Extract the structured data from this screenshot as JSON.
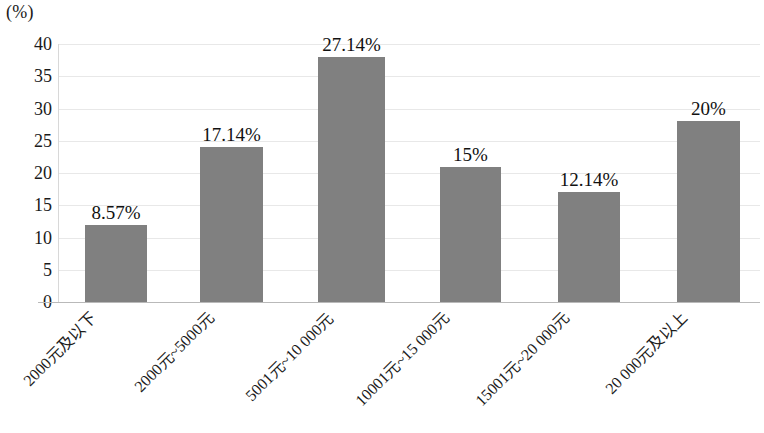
{
  "chart_data": {
    "type": "bar",
    "title": "",
    "subtitle": "",
    "xlabel": "",
    "ylabel": "(%)",
    "unit_caption": "(%)",
    "categories": [
      "2000元及以下",
      "2000元~5000元",
      "5001元~10 000元",
      "10001元~15 000元",
      "15001元~20 000元",
      "20 000元及以上"
    ],
    "values": [
      8.57,
      17.14,
      27.14,
      15,
      12.14,
      20
    ],
    "data_labels": [
      "8.57%",
      "17.14%",
      "27.14%",
      "15%",
      "12.14%",
      "20%"
    ],
    "bar_plot_heights": [
      12,
      24,
      38,
      21,
      17,
      28
    ],
    "ylim": [
      0,
      40
    ],
    "ytick_values": [
      40,
      35,
      30,
      25,
      20,
      15,
      10,
      5,
      0
    ],
    "ytick_labels": [
      "40",
      "35",
      "30",
      "25",
      "20",
      "15",
      "10",
      "5",
      "0"
    ],
    "grid": true,
    "grid_axis": "y",
    "legend": false,
    "legend_position": "none",
    "bar_color": "#808080",
    "grid_color": "#e8e8e8",
    "axis_color": "#b9b9b9",
    "text_color": "#1a1a1a"
  }
}
